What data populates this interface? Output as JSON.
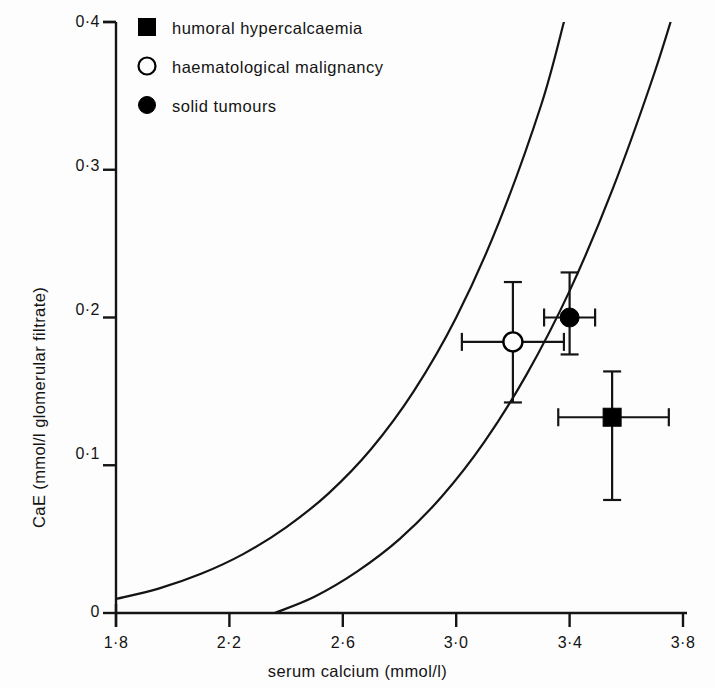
{
  "chart_data": {
    "type": "scatter",
    "title": "",
    "xlabel": "serum calcium (mmol/l)",
    "ylabel": "CaE (mmol/l glomerular filtrate)",
    "xlim": [
      1.8,
      3.8
    ],
    "ylim": [
      0,
      0.4
    ],
    "grid": false,
    "legend_position": "top-left",
    "x_ticks": [
      {
        "value": 1.8,
        "label": "1·8"
      },
      {
        "value": 2.2,
        "label": "2·2"
      },
      {
        "value": 2.6,
        "label": "2·6"
      },
      {
        "value": 3.0,
        "label": "3·0"
      },
      {
        "value": 3.4,
        "label": "3·4"
      },
      {
        "value": 3.8,
        "label": "3·8"
      }
    ],
    "y_ticks": [
      {
        "value": 0.0,
        "label": "0"
      },
      {
        "value": 0.1,
        "label": "0·1"
      },
      {
        "value": 0.2,
        "label": "0·2"
      },
      {
        "value": 0.3,
        "label": "0·3"
      },
      {
        "value": 0.4,
        "label": "0·4"
      }
    ],
    "series": [
      {
        "name": "humoral hypercalcaemia",
        "marker": "filled-square",
        "color": "#000000",
        "points": [
          {
            "x": 3.55,
            "y": 0.1325,
            "x_err_low": 3.36,
            "x_err_high": 3.75,
            "y_err_low": 0.0765,
            "y_err_high": 0.1635
          }
        ]
      },
      {
        "name": "haematological malignancy",
        "marker": "open-circle",
        "color": "#000000",
        "points": [
          {
            "x": 3.2,
            "y": 0.1835,
            "x_err_low": 3.02,
            "x_err_high": 3.38,
            "y_err_low": 0.1425,
            "y_err_high": 0.224
          }
        ]
      },
      {
        "name": "solid tumours",
        "marker": "filled-circle",
        "color": "#000000",
        "points": [
          {
            "x": 3.4,
            "y": 0.2,
            "x_err_low": 3.31,
            "x_err_high": 3.49,
            "y_err_low": 0.175,
            "y_err_high": 0.2305
          }
        ]
      }
    ],
    "curves": [
      {
        "name": "lower reference curve",
        "description": "left exponential reference curve rising from y-axis",
        "points": [
          {
            "x": 1.8,
            "y": 0.0095
          },
          {
            "x": 1.95,
            "y": 0.0165
          },
          {
            "x": 2.1,
            "y": 0.0265
          },
          {
            "x": 2.25,
            "y": 0.04
          },
          {
            "x": 2.4,
            "y": 0.058
          },
          {
            "x": 2.55,
            "y": 0.081
          },
          {
            "x": 2.7,
            "y": 0.111
          },
          {
            "x": 2.85,
            "y": 0.15
          },
          {
            "x": 3.0,
            "y": 0.2
          },
          {
            "x": 3.15,
            "y": 0.264
          },
          {
            "x": 3.3,
            "y": 0.344
          },
          {
            "x": 3.38,
            "y": 0.4
          }
        ]
      },
      {
        "name": "upper reference curve",
        "description": "right exponential reference curve rising from x-axis at ~2.36",
        "points": [
          {
            "x": 2.36,
            "y": 0.0
          },
          {
            "x": 2.5,
            "y": 0.011
          },
          {
            "x": 2.65,
            "y": 0.028
          },
          {
            "x": 2.8,
            "y": 0.05
          },
          {
            "x": 2.95,
            "y": 0.079
          },
          {
            "x": 3.1,
            "y": 0.116
          },
          {
            "x": 3.25,
            "y": 0.162
          },
          {
            "x": 3.4,
            "y": 0.218
          },
          {
            "x": 3.55,
            "y": 0.286
          },
          {
            "x": 3.7,
            "y": 0.366
          },
          {
            "x": 3.8,
            "y": 0.428
          }
        ]
      }
    ]
  },
  "legend": {
    "entries": [
      {
        "label": "humoral hypercalcaemia",
        "marker": "filled-square"
      },
      {
        "label": "haematological malignancy",
        "marker": "open-circle"
      },
      {
        "label": "solid tumours",
        "marker": "filled-circle"
      }
    ]
  },
  "axes": {
    "x_title": "serum calcium (mmol/l)",
    "y_title": "CaE (mmol/l glomerular filtrate)",
    "axis_color": "#141414"
  }
}
